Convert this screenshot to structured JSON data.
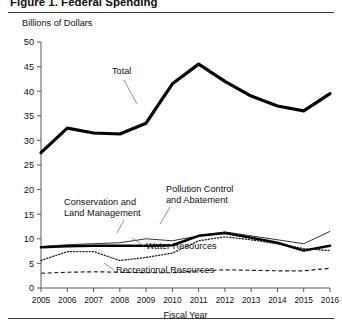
{
  "figure": {
    "title_partial": "Figure 1. Federal Spending",
    "y_axis_title": "Billions of Dollars",
    "x_axis_label": "Fiscal Year"
  },
  "chart_data": {
    "type": "line",
    "title": "",
    "xlabel": "Fiscal Year",
    "ylabel": "Billions of Dollars",
    "grid": false,
    "legend": "inline-annotations",
    "categories": [
      2005,
      2006,
      2007,
      2008,
      2009,
      2010,
      2011,
      2012,
      2013,
      2014,
      2015,
      2016
    ],
    "xlim": [
      2005,
      2016
    ],
    "ylim": [
      0,
      50
    ],
    "ytick_labels": [
      "0",
      "5",
      "10",
      "15",
      "20",
      "25",
      "30",
      "35",
      "40",
      "45",
      "50"
    ],
    "ytick_values": [
      0,
      5,
      10,
      15,
      20,
      25,
      30,
      35,
      40,
      45,
      50
    ],
    "xtick_labels": [
      "2005",
      "2006",
      "2007",
      "2008",
      "2009",
      "2010",
      "2011",
      "2012",
      "2013",
      "2014",
      "2015",
      "2016"
    ],
    "series": [
      {
        "name": "Total",
        "style": "thick-solid",
        "values": [
          27.5,
          32.5,
          31.5,
          31.3,
          33.5,
          41.5,
          45.5,
          42.0,
          39.0,
          37.0,
          36.0,
          39.5
        ]
      },
      {
        "name": "Pollution Control and Abatement",
        "style": "thin-solid",
        "values": [
          8.4,
          8.8,
          9.0,
          9.2,
          10.0,
          9.6,
          10.6,
          11.4,
          10.6,
          9.8,
          9.0,
          11.5
        ]
      },
      {
        "name": "Conservation and Land Management",
        "style": "thick-solid-lower",
        "values": [
          8.3,
          8.5,
          8.6,
          8.6,
          8.6,
          8.7,
          10.6,
          11.2,
          10.2,
          9.2,
          7.6,
          8.6
        ]
      },
      {
        "name": "Water Resources",
        "style": "dotted",
        "values": [
          5.6,
          7.4,
          7.4,
          5.6,
          6.2,
          7.1,
          9.6,
          10.4,
          9.8,
          9.0,
          8.0,
          7.6
        ]
      },
      {
        "name": "Recreational Resources",
        "style": "dashed",
        "values": [
          3.0,
          3.2,
          3.3,
          3.2,
          3.1,
          3.1,
          3.5,
          3.7,
          3.6,
          3.5,
          3.5,
          4.0
        ]
      }
    ],
    "annotations": [
      {
        "label": "Total",
        "x": 112,
        "y": 74
      },
      {
        "label": "Conservation and",
        "x": 64,
        "y": 205
      },
      {
        "label": "Land Management",
        "x": 64,
        "y": 216
      },
      {
        "label": "Pollution Control",
        "x": 166,
        "y": 192
      },
      {
        "label": "and Abatement",
        "x": 166,
        "y": 203
      },
      {
        "label": "Water Resources",
        "x": 146,
        "y": 249
      },
      {
        "label": "Recreational Resources",
        "x": 116,
        "y": 273
      }
    ]
  }
}
